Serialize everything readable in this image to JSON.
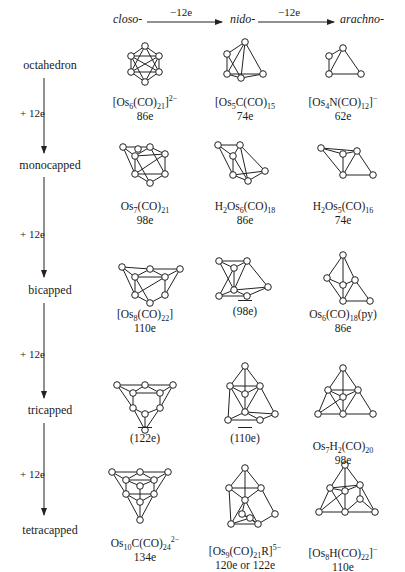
{
  "header": {
    "columns": [
      "closo-",
      "nido-",
      "arachno-"
    ],
    "arrows": [
      "−12e",
      "−12e"
    ]
  },
  "rows": [
    {
      "label": "octahedron"
    },
    {
      "label": "monocapped"
    },
    {
      "label": "bicapped"
    },
    {
      "label": "tricapped"
    },
    {
      "label": "tetracapped"
    }
  ],
  "step_label": "+ 12e",
  "cells": {
    "octahedron": {
      "closo": {
        "formula_html": "[Os<sub>6</sub>(CO)<sub>21</sub>]<sup>2−</sup>",
        "electrons": "86e"
      },
      "nido": {
        "formula_html": "[Os<sub>5</sub>C(CO)<sub>15</sub>",
        "electrons": "74e"
      },
      "arachno": {
        "formula_html": "[Os<sub>4</sub>N(CO)<sub>12</sub>]<sup>−</sup>",
        "electrons": "62e"
      }
    },
    "monocapped": {
      "closo": {
        "formula_html": "Os<sub>7</sub>(CO)<sub>21</sub>",
        "electrons": "98e"
      },
      "nido": {
        "formula_html": "H<sub>2</sub>Os<sub>6</sub>(CO)<sub>18</sub>",
        "electrons": "86e"
      },
      "arachno": {
        "formula_html": "H<sub>2</sub>Os<sub>5</sub>(CO)<sub>16</sub>",
        "electrons": "74e"
      }
    },
    "bicapped": {
      "closo": {
        "formula_html": "[Os<sub>8</sub>(CO)<sub>22</sub>]",
        "electrons": "110e"
      },
      "nido": {
        "formula_html": "",
        "electrons": "(98e)",
        "unknown": true
      },
      "arachno": {
        "formula_html": "Os<sub>6</sub>(CO)<sub>18</sub>(py)",
        "electrons": "86e"
      }
    },
    "tricapped": {
      "closo": {
        "formula_html": "",
        "electrons": "(122e)",
        "unknown": true
      },
      "nido": {
        "formula_html": "",
        "electrons": "(110e)",
        "unknown": true
      },
      "arachno": {
        "formula_html": "Os<sub>7</sub>H<sub>2</sub>(CO)<sub>20</sub>",
        "electrons": "98e"
      }
    },
    "tetracapped": {
      "closo": {
        "formula_html": "Os<sub>10</sub>C(CO)<sub>24</sub><sup>2−</sup>",
        "electrons": "134e"
      },
      "nido": {
        "formula_html": "[Os<sub>9</sub>(CO)<sub>21</sub>R]<sup>5−</sup>",
        "electrons": "120e or 122e"
      },
      "arachno": {
        "formula_html": "[Os<sub>8</sub>H(CO)<sub>22</sub>]<sup>−</sup>",
        "electrons": "110e"
      }
    }
  }
}
